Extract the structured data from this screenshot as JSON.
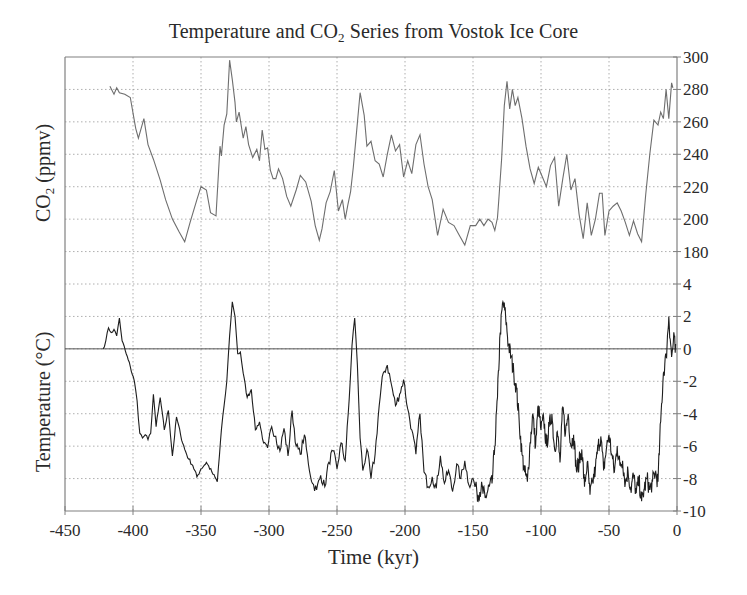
{
  "chart_data": [
    {
      "type": "line",
      "title": "Temperature and CO2 Series from Vostok Ice Core",
      "title_parts": {
        "pre": "Temperature and CO",
        "sub": "2",
        "post": " Series from Vostok Ice Core"
      },
      "xlabel": "Time (kyr)",
      "ylabel": "CO2 (ppmv)",
      "ylabel_parts": {
        "pre": "CO",
        "sub": "2",
        "post": " (ppmv)"
      },
      "series_name": "CO2",
      "xlim": [
        -450,
        0
      ],
      "ylim": [
        180,
        300
      ],
      "y_axis_side": "right",
      "y_ticks": [
        300,
        280,
        260,
        240,
        220,
        200,
        180
      ],
      "x": [
        -417,
        -414,
        -412,
        -410,
        -406,
        -402,
        -398,
        -396,
        -392,
        -389,
        -385,
        -380,
        -376,
        -371,
        -366,
        -362,
        -358,
        -353,
        -350,
        -346,
        -343,
        -339,
        -336,
        -335,
        -333,
        -331,
        -329,
        -327,
        -325,
        -324,
        -322,
        -319,
        -317,
        -315,
        -312,
        -309,
        -307,
        -305,
        -303,
        -301,
        -299,
        -297,
        -295,
        -293,
        -290,
        -287,
        -284,
        -280,
        -277,
        -273,
        -269,
        -266,
        -263,
        -261,
        -258,
        -255,
        -252,
        -249,
        -246,
        -244,
        -242,
        -240,
        -238,
        -236,
        -233,
        -230,
        -228,
        -225,
        -222,
        -219,
        -216,
        -213,
        -210,
        -207,
        -204,
        -201,
        -198,
        -195,
        -192,
        -189,
        -186,
        -183,
        -180,
        -176,
        -172,
        -168,
        -164,
        -160,
        -156,
        -152,
        -148,
        -145,
        -142,
        -139,
        -136,
        -134,
        -132,
        -131,
        -129,
        -127,
        -125,
        -123,
        -121,
        -119,
        -117,
        -114,
        -111,
        -108,
        -105,
        -102,
        -99,
        -96,
        -93,
        -90,
        -87,
        -84,
        -81,
        -78,
        -75,
        -72,
        -69,
        -66,
        -63,
        -60,
        -57,
        -55,
        -53,
        -50,
        -47,
        -44,
        -41,
        -38,
        -35,
        -32,
        -29,
        -26,
        -23,
        -20,
        -17,
        -14,
        -12,
        -10,
        -8,
        -6,
        -4,
        -3
      ],
      "values": [
        282,
        277,
        281,
        278,
        277,
        275,
        256,
        250,
        262,
        246,
        237,
        224,
        212,
        200,
        192,
        186,
        198,
        212,
        220,
        218,
        204,
        202,
        245,
        239,
        258,
        265,
        298,
        286,
        272,
        260,
        266,
        250,
        257,
        246,
        238,
        243,
        236,
        255,
        243,
        244,
        230,
        225,
        225,
        231,
        225,
        214,
        208,
        218,
        227,
        223,
        211,
        196,
        187,
        194,
        210,
        217,
        230,
        205,
        212,
        200,
        209,
        217,
        232,
        250,
        278,
        264,
        245,
        248,
        236,
        234,
        226,
        240,
        252,
        242,
        246,
        226,
        236,
        228,
        246,
        252,
        234,
        220,
        212,
        190,
        206,
        198,
        196,
        190,
        184,
        196,
        196,
        200,
        196,
        200,
        198,
        193,
        201,
        212,
        237,
        270,
        285,
        268,
        280,
        270,
        275,
        262,
        245,
        231,
        222,
        232,
        226,
        220,
        233,
        238,
        208,
        225,
        240,
        218,
        225,
        203,
        188,
        210,
        190,
        200,
        216,
        216,
        190,
        205,
        208,
        210,
        205,
        198,
        190,
        199,
        191,
        186,
        215,
        240,
        261,
        258,
        266,
        262,
        280,
        262,
        284,
        281
      ]
    },
    {
      "type": "line",
      "xlabel": "Time (kyr)",
      "ylabel": "Temperature (°C)",
      "series_name": "Temperature",
      "xlim": [
        -450,
        0
      ],
      "ylim": [
        -10,
        4
      ],
      "y_axis_side": "right",
      "y_ticks": [
        4,
        2,
        0,
        -2,
        -4,
        -6,
        -8,
        -10
      ],
      "x_ticks": [
        -450,
        -400,
        -350,
        -300,
        -250,
        -200,
        -150,
        -100,
        -50,
        0
      ],
      "zero_line": true,
      "grid": true,
      "x": [
        -422,
        -420,
        -418,
        -416,
        -414,
        -412,
        -410,
        -408,
        -405,
        -402,
        -399,
        -397,
        -395,
        -393,
        -391,
        -389,
        -387,
        -385,
        -383,
        -380,
        -377,
        -374,
        -371,
        -368,
        -365,
        -362,
        -359,
        -356,
        -353,
        -350,
        -346,
        -342,
        -338,
        -335,
        -333,
        -331,
        -329,
        -327,
        -325,
        -323,
        -321,
        -319,
        -316,
        -313,
        -310,
        -307,
        -304,
        -301,
        -298,
        -295,
        -292,
        -289,
        -286,
        -283,
        -280,
        -277,
        -274,
        -271,
        -268,
        -265,
        -262,
        -259,
        -256,
        -253,
        -250,
        -247,
        -244,
        -241,
        -239,
        -237,
        -235,
        -233,
        -231,
        -228,
        -225,
        -222,
        -219,
        -216,
        -213,
        -210,
        -207,
        -204,
        -201,
        -198,
        -195,
        -192,
        -189,
        -186,
        -183,
        -180,
        -177,
        -174,
        -171,
        -168,
        -165,
        -162,
        -159,
        -156,
        -153,
        -150,
        -147,
        -144,
        -141,
        -138,
        -136,
        -134,
        -132,
        -130,
        -128,
        -126,
        -124,
        -122,
        -120,
        -118,
        -116,
        -114,
        -112,
        -110,
        -108,
        -106,
        -104,
        -102,
        -100,
        -98,
        -96,
        -94,
        -92,
        -90,
        -88,
        -86,
        -84,
        -82,
        -80,
        -78,
        -76,
        -74,
        -72,
        -70,
        -68,
        -66,
        -64,
        -62,
        -60,
        -58,
        -56,
        -54,
        -52,
        -50,
        -48,
        -46,
        -44,
        -42,
        -40,
        -38,
        -36,
        -34,
        -32,
        -30,
        -28,
        -26,
        -24,
        -22,
        -20,
        -18,
        -16,
        -14,
        -12,
        -10,
        -8,
        -6,
        -4,
        -2,
        -1
      ],
      "values": [
        0.0,
        0.5,
        1.3,
        1.0,
        1.2,
        0.8,
        1.9,
        0.5,
        -0.3,
        -1.1,
        -2.0,
        -3.2,
        -5.2,
        -5.5,
        -5.3,
        -5.6,
        -5.2,
        -2.8,
        -4.8,
        -3.0,
        -5.0,
        -3.8,
        -6.6,
        -4.2,
        -5.3,
        -6.2,
        -6.8,
        -7.2,
        -7.9,
        -7.4,
        -7.0,
        -7.6,
        -8.2,
        -5.0,
        -3.5,
        -2.0,
        0.8,
        2.9,
        2.0,
        -0.3,
        -0.2,
        -1.5,
        -3.0,
        -2.5,
        -5.0,
        -4.5,
        -5.8,
        -6.1,
        -4.8,
        -5.4,
        -6.3,
        -4.9,
        -6.6,
        -3.8,
        -6.0,
        -6.5,
        -5.3,
        -7.1,
        -8.3,
        -8.7,
        -7.8,
        -8.5,
        -7.0,
        -6.3,
        -7.4,
        -5.8,
        -6.9,
        -3.1,
        0.2,
        1.9,
        -1.0,
        -5.5,
        -7.5,
        -6.2,
        -8.0,
        -6.5,
        -3.5,
        -1.5,
        -1.0,
        -2.2,
        -3.5,
        -2.8,
        -1.9,
        -3.7,
        -5.0,
        -6.5,
        -4.0,
        -7.6,
        -8.5,
        -7.9,
        -8.6,
        -6.6,
        -8.3,
        -7.5,
        -8.8,
        -7.1,
        -8.0,
        -6.9,
        -8.4,
        -8.0,
        -9.0,
        -8.6,
        -9.2,
        -8.5,
        -8.3,
        -6.0,
        -3.0,
        1.0,
        2.9,
        2.0,
        0.3,
        -0.5,
        -1.5,
        -2.5,
        -4.5,
        -6.5,
        -7.6,
        -8.2,
        -5.8,
        -4.0,
        -6.0,
        -3.5,
        -5.0,
        -4.3,
        -6.0,
        -4.8,
        -4.0,
        -6.2,
        -5.1,
        -7.0,
        -3.6,
        -5.2,
        -4.0,
        -6.0,
        -5.3,
        -7.5,
        -7.0,
        -6.2,
        -8.5,
        -7.0,
        -9.0,
        -8.2,
        -7.4,
        -6.0,
        -5.4,
        -7.5,
        -6.2,
        -5.3,
        -6.5,
        -7.6,
        -6.0,
        -7.2,
        -6.9,
        -8.3,
        -7.5,
        -8.7,
        -7.8,
        -8.9,
        -8.1,
        -9.4,
        -8.6,
        -8.0,
        -8.7,
        -8.2,
        -7.6,
        -8.2,
        -4.5,
        -1.5,
        -0.5,
        2.0,
        -0.5,
        0.8,
        -0.7,
        1.3,
        -1.0,
        0.3
      ]
    }
  ],
  "chart_title": {
    "pre": "Temperature and CO",
    "sub": "2",
    "post": " Series from Vostok Ice Core"
  },
  "axes": {
    "xlabel": "Time (kyr)",
    "ylabel_top": {
      "pre": "CO",
      "sub": "2",
      "post": " (ppmv)"
    },
    "ylabel_bottom": "Temperature (°C)",
    "x_tick_labels": [
      "-450",
      "-400",
      "-350",
      "-300",
      "-250",
      "-200",
      "-150",
      "-100",
      "-50",
      "0"
    ],
    "right_tick_labels": [
      "300",
      "280",
      "260",
      "240",
      "220",
      "200",
      "180",
      "4",
      "2",
      "0",
      "-2",
      "-4",
      "-6",
      "-8",
      "-10"
    ]
  },
  "colors": {
    "co2_line": "#6e6e6e",
    "temp_line": "#1e1e1e",
    "axis": "#808080",
    "grid": "#9a9a9a",
    "text": "#2a2a2a"
  }
}
